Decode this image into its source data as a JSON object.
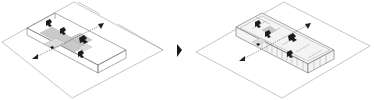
{
  "diagram": {
    "type": "architectural-axonometric-sequence",
    "panels": [
      {
        "name": "before",
        "description": "Open transparent volume on site plane with cross-shaped shaded circulation and figures, dashed axis arrows"
      },
      {
        "name": "after",
        "description": "Subdivided volume with cellular rooms along the long side, figures and dashed axis arrows"
      }
    ],
    "transition": {
      "glyph": "triangle-right",
      "color": "#1a1a1a"
    },
    "colors": {
      "line": "#8a8a8a",
      "fill": "#c9c9c9",
      "figure": "#1c1c1c",
      "background": "#ffffff"
    }
  }
}
